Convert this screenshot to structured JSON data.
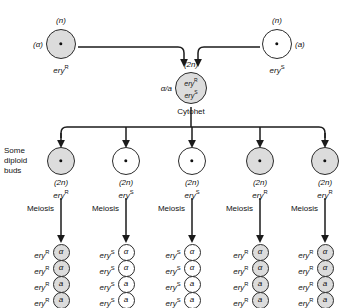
{
  "figure": {
    "colors": {
      "shaded": "#dcdcdc",
      "plain": "#ffffff",
      "stroke": "#2b2b2b",
      "text": "#111111"
    }
  },
  "parents": [
    {
      "id": "parent-alpha",
      "ploidy": "(n)",
      "mating_type": "(α)",
      "mating_type_side": "left",
      "genotype_base": "ery",
      "genotype_sup": "R",
      "fill": "shaded",
      "cx": 61,
      "cy": 44,
      "r": 15
    },
    {
      "id": "parent-a",
      "ploidy": "(n)",
      "mating_type": "(a)",
      "mating_type_side": "right",
      "genotype_base": "ery",
      "genotype_sup": "S",
      "fill": "plain",
      "cx": 277,
      "cy": 44,
      "r": 15
    }
  ],
  "cytohet": {
    "ploidy": "(2n)",
    "mating_type": "α/a",
    "line1_base": "ery",
    "line1_sup": "R",
    "line2_base": "ery",
    "line2_sup": "S",
    "caption": "Cytohet",
    "fill": "shaded",
    "cx": 191,
    "cy": 88,
    "r": 16
  },
  "buds_label": "Some\ndiploid\nbuds",
  "meiosis_label": "Meiosis",
  "buds": [
    {
      "cx": 61,
      "ploidy": "(2n)",
      "genotype_base": "ery",
      "genotype_sup": "R",
      "fill": "shaded"
    },
    {
      "cx": 126,
      "ploidy": "(2n)",
      "genotype_base": "ery",
      "genotype_sup": "S",
      "fill": "plain"
    },
    {
      "cx": 192,
      "ploidy": "(2n)",
      "genotype_base": "ery",
      "genotype_sup": "S",
      "fill": "plain"
    },
    {
      "cx": 260,
      "ploidy": "(2n)",
      "genotype_base": "ery",
      "genotype_sup": "R",
      "fill": "shaded"
    },
    {
      "cx": 325,
      "ploidy": "(2n)",
      "genotype_base": "ery",
      "genotype_sup": "R",
      "fill": "shaded"
    }
  ],
  "tetrads": [
    {
      "cx": 61,
      "fill": "shaded",
      "genotype_base": "ery",
      "genotype_sup": "R",
      "spores": [
        "α",
        "α",
        "a",
        "a"
      ]
    },
    {
      "cx": 126,
      "fill": "plain",
      "genotype_base": "ery",
      "genotype_sup": "S",
      "spores": [
        "α",
        "α",
        "a",
        "a"
      ]
    },
    {
      "cx": 192,
      "fill": "plain",
      "genotype_base": "ery",
      "genotype_sup": "S",
      "spores": [
        "α",
        "α",
        "a",
        "a"
      ]
    },
    {
      "cx": 260,
      "fill": "shaded",
      "genotype_base": "ery",
      "genotype_sup": "R",
      "spores": [
        "α",
        "α",
        "a",
        "a"
      ]
    },
    {
      "cx": 325,
      "fill": "shaded",
      "genotype_base": "ery",
      "genotype_sup": "R",
      "spores": [
        "α",
        "α",
        "a",
        "a"
      ]
    }
  ],
  "geometry": {
    "bud_cy": 161,
    "bud_r": 14,
    "tetrad_top_cy": 252,
    "tetrad_step": 16,
    "tetrad_r": 8.5,
    "bus_y": 127,
    "fusion_y": 47
  }
}
